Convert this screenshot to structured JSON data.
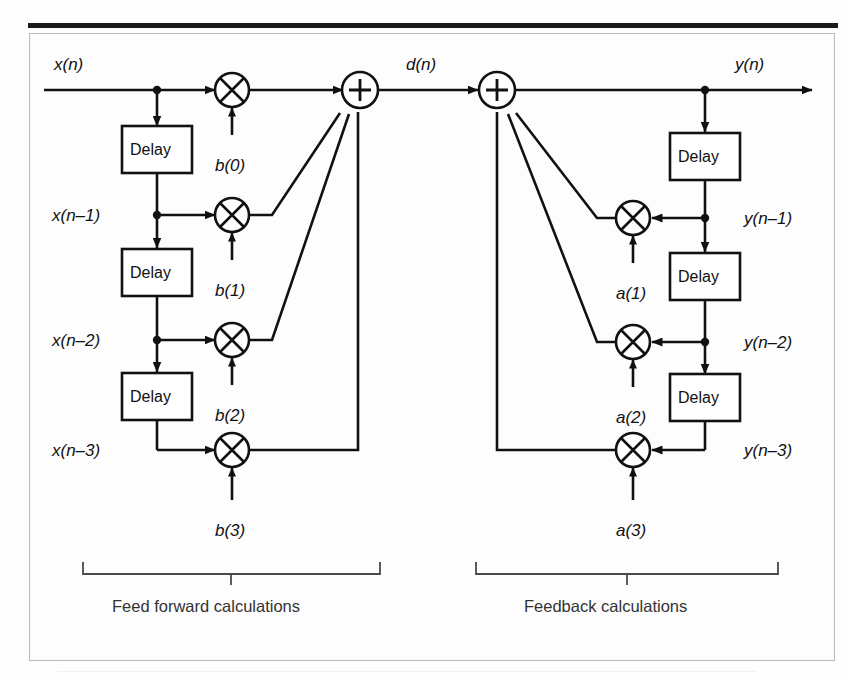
{
  "figure": {
    "type": "signal-flow-diagram",
    "input_label": "x(n)",
    "intermediate_label": "d(n)",
    "output_label": "y(n)",
    "delay_block_label": "Delay",
    "sum_symbol": "+",
    "multiply_symbol": "x"
  },
  "feedforward": {
    "bracket_label": "Feed forward calculations",
    "taps": [
      {
        "signal": "x(n)",
        "coefficient": "b(0)"
      },
      {
        "signal": "x(n–1)",
        "coefficient": "b(1)"
      },
      {
        "signal": "x(n–2)",
        "coefficient": "b(2)"
      },
      {
        "signal": "x(n–3)",
        "coefficient": "b(3)"
      }
    ],
    "delay_count": 3
  },
  "feedback": {
    "bracket_label": "Feedback calculations",
    "taps": [
      {
        "signal": "y(n–1)",
        "coefficient": "a(1)"
      },
      {
        "signal": "y(n–2)",
        "coefficient": "a(2)"
      },
      {
        "signal": "y(n–3)",
        "coefficient": "a(3)"
      }
    ],
    "delay_count": 3
  },
  "colors": {
    "ink": "#111111",
    "frame": "#b9b9b9",
    "bracket": "#333333",
    "page": "#ffffff"
  }
}
